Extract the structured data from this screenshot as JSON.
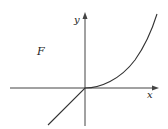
{
  "figure": {
    "region_label": "F",
    "x_axis_label": "x",
    "y_axis_label": "y",
    "line_color": "#333333"
  }
}
